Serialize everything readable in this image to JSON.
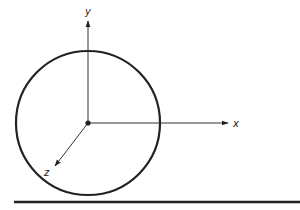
{
  "diagram": {
    "type": "3d-coordinate-axes-with-circle",
    "colors": {
      "stroke": "#222222",
      "background": "#ffffff"
    },
    "origin": {
      "x": 88,
      "y": 123
    },
    "circle": {
      "cx": 88,
      "cy": 123,
      "r": 72
    },
    "axes": [
      {
        "name": "x",
        "label": "x",
        "tip": {
          "x": 228,
          "y": 123
        },
        "label_pos": {
          "x": 233,
          "y": 127
        }
      },
      {
        "name": "y",
        "label": "y",
        "tip": {
          "x": 88,
          "y": 21
        },
        "label_pos": {
          "x": 85,
          "y": 15
        }
      },
      {
        "name": "z",
        "label": "z",
        "tip": {
          "x": 55,
          "y": 166
        },
        "label_pos": {
          "x": 44,
          "y": 176
        }
      }
    ],
    "baseline": {
      "x1": 14,
      "x2": 300,
      "y": 202
    }
  }
}
